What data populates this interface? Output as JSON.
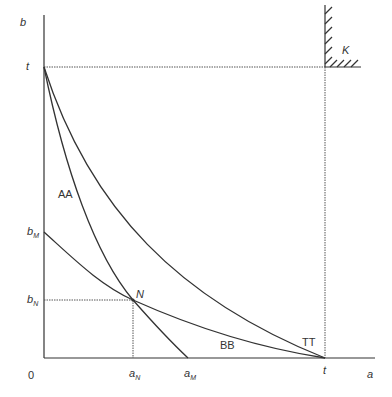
{
  "diagram": {
    "axes": {
      "x_label": "a",
      "y_label": "b",
      "origin_label": "0"
    },
    "y_ticks": [
      {
        "main": "t",
        "sub": ""
      },
      {
        "main": "b",
        "sub": "M"
      },
      {
        "main": "b",
        "sub": "N"
      }
    ],
    "x_ticks": [
      {
        "main": "a",
        "sub": "N"
      },
      {
        "main": "a",
        "sub": "M"
      },
      {
        "main": "t",
        "sub": ""
      }
    ],
    "curves": [
      {
        "label": "AA",
        "description": "steep convex curve from (0,t) through N to (a_M,0)"
      },
      {
        "label": "BB",
        "description": "flatter convex curve from (0,b_M) through N to (t,0)"
      },
      {
        "label": "TT",
        "description": "outer convex curve from (0,t) to (t,0)"
      }
    ],
    "points": [
      {
        "label": "N"
      }
    ],
    "region": {
      "label": "K"
    }
  },
  "colors": {
    "line": "#333333",
    "dotted": "#555555",
    "background": "#ffffff"
  }
}
